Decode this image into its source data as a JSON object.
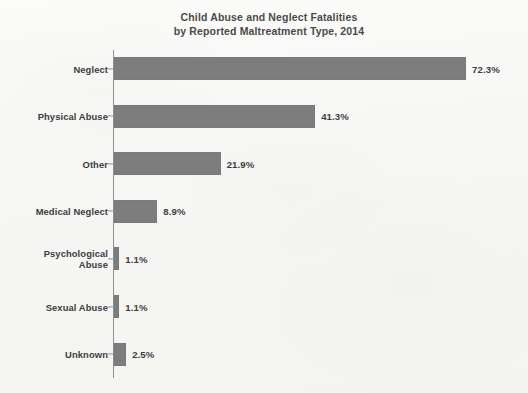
{
  "chart_data": {
    "type": "bar",
    "orientation": "horizontal",
    "title": "Child Abuse and Neglect Fatalities\nby Reported Maltreatment Type, 2014",
    "title_line1": "Child Abuse and Neglect Fatalities",
    "title_line2": "by Reported Maltreatment Type, 2014",
    "xlabel": "",
    "ylabel": "",
    "xlim": [
      0,
      80
    ],
    "grid": false,
    "legend": false,
    "bar_color": "#7d7d7d",
    "text_color": "#3d3d3d",
    "axis_color": "#8f8f8f",
    "background_color": "#f8f8f6",
    "categories": [
      "Neglect",
      "Physical Abuse",
      "Other",
      "Medical Neglect",
      "Psychological\nAbuse",
      "Sexual Abuse",
      "Unknown"
    ],
    "values": [
      72.3,
      41.3,
      21.9,
      8.9,
      1.1,
      1.1,
      2.5
    ],
    "value_labels": [
      "72.3%",
      "41.3%",
      "21.9%",
      "8.9%",
      "1.1%",
      "1.1%",
      "2.5%"
    ],
    "bars": [
      {
        "category": "Neglect",
        "value": 72.3,
        "label": "72.3%"
      },
      {
        "category": "Physical Abuse",
        "value": 41.3,
        "label": "41.3%"
      },
      {
        "category": "Other",
        "value": 21.9,
        "label": "21.9%"
      },
      {
        "category": "Medical Neglect",
        "value": 8.9,
        "label": "8.9%"
      },
      {
        "category": "Psychological\nAbuse",
        "value": 1.1,
        "label": "1.1%"
      },
      {
        "category": "Sexual Abuse",
        "value": 1.1,
        "label": "1.1%"
      },
      {
        "category": "Unknown",
        "value": 2.5,
        "label": "2.5%"
      }
    ]
  }
}
